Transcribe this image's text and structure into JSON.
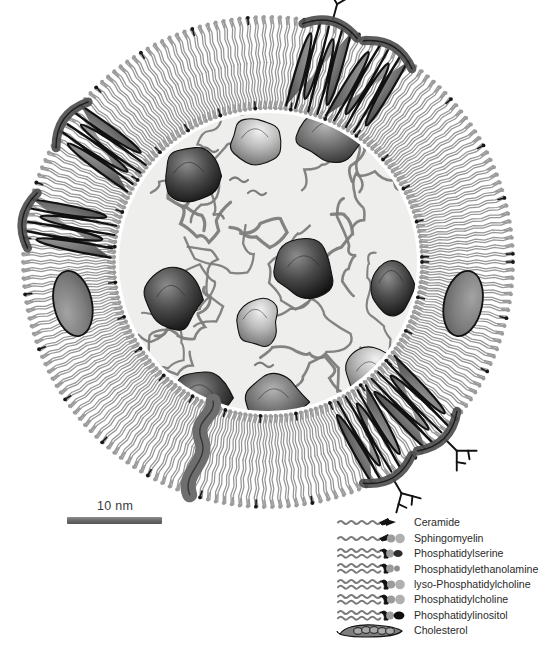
{
  "figure": {
    "background_color": "#ffffff",
    "lumen_color": "#eeeeec",
    "membrane_color": "#8a8a8a",
    "protein_color": "#6f6f6f",
    "outline_color": "#1a1a1a"
  },
  "scale_bar": {
    "label": "10 nm",
    "length_px": 95
  },
  "legend": {
    "items": [
      {
        "label": "Ceramide",
        "icon": "lipid-tail-chain-icon",
        "heads": 0,
        "head_style": "none",
        "tail_count": 1
      },
      {
        "label": "Sphingomyelin",
        "icon": "lipid-two-gray-heads-icon",
        "heads": 2,
        "head_style": "gray-gray",
        "tail_count": 1
      },
      {
        "label": "Phosphatidylserine",
        "icon": "lipid-dark-small-head-icon",
        "heads": 2,
        "head_style": "gray-dark",
        "tail_count": 2
      },
      {
        "label": "Phosphatidylethanolamine",
        "icon": "lipid-small-gray-head-icon",
        "heads": 2,
        "head_style": "gray-small",
        "tail_count": 2
      },
      {
        "label": "lyso-Phosphatidylcholine",
        "icon": "lipid-two-gray-heads-icon",
        "heads": 2,
        "head_style": "gray-gray",
        "tail_count": 2
      },
      {
        "label": "Phosphatidylcholine",
        "icon": "lipid-two-gray-heads-icon",
        "heads": 2,
        "head_style": "gray-gray",
        "tail_count": 2
      },
      {
        "label": "Phosphatidylinositol",
        "icon": "lipid-black-head-icon",
        "heads": 2,
        "head_style": "gray-black",
        "tail_count": 2
      },
      {
        "label": "Cholesterol",
        "icon": "cholesterol-ring-icon",
        "heads": 0,
        "head_style": "sterol",
        "tail_count": 0
      }
    ]
  },
  "vesicle": {
    "center": {
      "x": 268,
      "y": 262
    },
    "outer_radius": 247,
    "inner_radius": 152,
    "lumen_radius": 148,
    "lipid_count": 190,
    "membrane_proteins": [
      {
        "type": "multipass-serpentine",
        "angle_deg": 285,
        "glycan": true
      },
      {
        "type": "multipass-serpentine",
        "angle_deg": 300,
        "glycan": false
      },
      {
        "type": "multipass-serpentine",
        "angle_deg": 60,
        "glycan": true
      },
      {
        "type": "multipass-serpentine",
        "angle_deg": 45,
        "glycan": true
      },
      {
        "type": "multipass-serpentine",
        "angle_deg": 190,
        "glycan": false
      },
      {
        "type": "multipass-serpentine",
        "angle_deg": 215,
        "glycan": false
      },
      {
        "type": "oval-cholesterol-patch",
        "angle_deg": 168,
        "glycan": false
      },
      {
        "type": "oval-cholesterol-patch",
        "angle_deg": 12,
        "glycan": false
      },
      {
        "type": "kinked-single-pass",
        "angle_deg": 110,
        "glycan": false
      }
    ],
    "lumen_proteins": [
      {
        "x": 190,
        "y": 176,
        "rx": 30,
        "ry": 28,
        "shade": "dark"
      },
      {
        "x": 256,
        "y": 141,
        "rx": 27,
        "ry": 25,
        "shade": "light"
      },
      {
        "x": 330,
        "y": 135,
        "rx": 33,
        "ry": 27,
        "shade": "mid"
      },
      {
        "x": 305,
        "y": 270,
        "rx": 32,
        "ry": 29,
        "shade": "dark"
      },
      {
        "x": 392,
        "y": 286,
        "rx": 24,
        "ry": 32,
        "shade": "dark"
      },
      {
        "x": 172,
        "y": 300,
        "rx": 28,
        "ry": 30,
        "shade": "dark"
      },
      {
        "x": 256,
        "y": 322,
        "rx": 24,
        "ry": 26,
        "shade": "light"
      },
      {
        "x": 200,
        "y": 398,
        "rx": 29,
        "ry": 27,
        "shade": "dark"
      },
      {
        "x": 275,
        "y": 402,
        "rx": 30,
        "ry": 27,
        "shade": "mid"
      },
      {
        "x": 370,
        "y": 374,
        "rx": 25,
        "ry": 25,
        "shade": "light"
      }
    ],
    "lumen_filament_clusters": [
      {
        "x": 215,
        "y": 215
      },
      {
        "x": 330,
        "y": 205
      },
      {
        "x": 165,
        "y": 320
      },
      {
        "x": 358,
        "y": 370
      }
    ]
  }
}
